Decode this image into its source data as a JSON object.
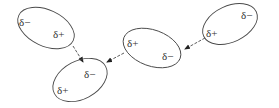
{
  "diagram": {
    "type": "dipole-dipole interactions",
    "stroke_color": "#4a4a4a",
    "text_color": "#333333",
    "molecules": [
      {
        "id": "molecule-1",
        "cx": 46,
        "cy": 28,
        "rx": 30,
        "ry": 18,
        "rotate": 25,
        "charges": [
          {
            "label": "δ−",
            "x": 19,
            "y": 26
          },
          {
            "label": "δ+",
            "x": 53,
            "y": 38
          }
        ]
      },
      {
        "id": "molecule-2",
        "cx": 80,
        "cy": 80,
        "rx": 29,
        "ry": 19,
        "rotate": -28,
        "charges": [
          {
            "label": "δ−",
            "x": 84,
            "y": 78
          },
          {
            "label": "δ+",
            "x": 57,
            "y": 94
          }
        ]
      },
      {
        "id": "molecule-3",
        "cx": 152,
        "cy": 48,
        "rx": 30,
        "ry": 18,
        "rotate": 20,
        "charges": [
          {
            "label": "δ+",
            "x": 127,
            "y": 47
          },
          {
            "label": "δ−",
            "x": 162,
            "y": 60
          }
        ]
      },
      {
        "id": "molecule-4",
        "cx": 230,
        "cy": 24,
        "rx": 29,
        "ry": 18,
        "rotate": -25,
        "charges": [
          {
            "label": "δ−",
            "x": 241,
            "y": 19
          },
          {
            "label": "δ+",
            "x": 206,
            "y": 37
          }
        ]
      }
    ],
    "interactions": [
      {
        "from": "molecule-1 δ+",
        "to": "molecule-2 δ−",
        "x1": 73,
        "y1": 46,
        "x2": 83,
        "y2": 62
      },
      {
        "from": "molecule-3 δ+",
        "to": "molecule-2 δ−",
        "x1": 124,
        "y1": 53,
        "x2": 107,
        "y2": 62
      },
      {
        "from": "molecule-4 δ+",
        "to": "molecule-3 δ−",
        "x1": 205,
        "y1": 38,
        "x2": 185,
        "y2": 49
      }
    ]
  }
}
